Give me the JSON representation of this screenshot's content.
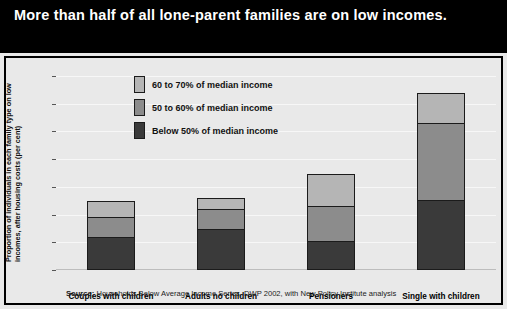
{
  "title": "More than half of all lone-parent families are on low incomes.",
  "source_prefix": "Source:",
  "source_text": " Households Below Average Income Series, DWP 2002, with New Policy Institute analysis",
  "colors": {
    "banner_background": "#000000",
    "banner_text": "#ffffff",
    "chart_background": "#e9e9e9",
    "series_below_50": "#3a3a3a",
    "series_50_to_60": "#8c8c8c",
    "series_60_to_70": "#b5b5b5",
    "frame_border": "#000000",
    "gridline": "#f7f7f7"
  },
  "chart_data": {
    "type": "bar",
    "stacked": true,
    "title": "More than half of all lone-parent families are on low incomes.",
    "xlabel": "",
    "ylabel": "Proportion of individuals in each family type on low incomes, after housing costs (per cent)",
    "categories": [
      "Couples with children",
      "Adults no children",
      "Pensioners",
      "Single with children"
    ],
    "series": [
      {
        "name": "Below 50% of median income",
        "color": "#3a3a3a",
        "values": [
          12,
          15,
          10,
          25
        ]
      },
      {
        "name": "50 to 60% of median income",
        "color": "#8c8c8c",
        "values": [
          7,
          7,
          13,
          28
        ]
      },
      {
        "name": "60 to 70% of median income",
        "color": "#b5b5b5",
        "values": [
          6,
          4,
          11.5,
          11
        ]
      }
    ],
    "totals": [
      25,
      26,
      34.5,
      64
    ],
    "ylim": [
      0,
      70
    ],
    "yticks": [
      0,
      10,
      20,
      30,
      40,
      50,
      60,
      70
    ],
    "ytick_labels": [
      "0",
      "10",
      "20",
      "30",
      "40",
      "50",
      "60",
      "70"
    ],
    "grid": true,
    "legend_position": "inside-top-left",
    "legend_order_top_to_bottom": [
      "60 to 70% of median income",
      "50 to 60% of median income",
      "Below 50% of median income"
    ]
  }
}
